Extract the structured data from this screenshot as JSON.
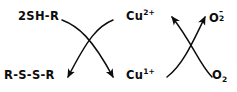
{
  "diagram": {
    "type": "curved-arrow reaction scheme",
    "background_color": "#ffffff",
    "stroke_color": "#0d0d0d",
    "labels": {
      "thiol": {
        "text": "2SH-R",
        "base": "2SH-R",
        "position": "top-left"
      },
      "disulfide": {
        "text": "R-S-S-R",
        "base": "R-S-S-R",
        "position": "bottom-left"
      },
      "copper_ii": {
        "base": "Cu",
        "sup": "2+",
        "text": "Cu2+",
        "position": "top-center"
      },
      "copper_i": {
        "base": "Cu",
        "sup": "1+",
        "text": "Cu1+",
        "position": "bottom-center"
      },
      "superoxide": {
        "base": "O",
        "sub": "2",
        "sup": "–",
        "text": "O2-",
        "position": "top-right"
      },
      "dioxygen": {
        "base": "O",
        "sub": "2",
        "text": "O2",
        "position": "bottom-right"
      }
    },
    "arrows": [
      {
        "name": "thiol-to-disulfide",
        "from": "2SH-R",
        "to": "R-S-S-R",
        "arrowhead": "end"
      },
      {
        "name": "copper-ii-to-copper-i",
        "from": "Cu2+",
        "to": "Cu1+",
        "arrowhead": "end"
      },
      {
        "name": "copper-i-to-copper-ii",
        "from": "Cu1+",
        "to": "Cu2+",
        "arrowhead": "end"
      },
      {
        "name": "dioxygen-to-superoxide",
        "from": "O2",
        "to": "O2-",
        "arrowhead": "end"
      }
    ]
  }
}
